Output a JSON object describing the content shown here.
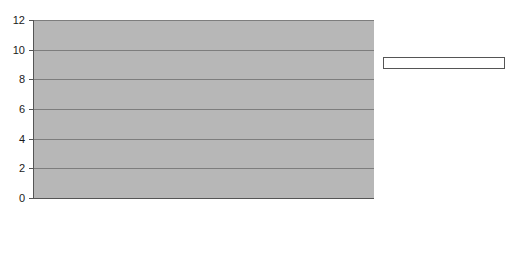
{
  "chart_data": {
    "type": "bar",
    "title": "",
    "xlabel": "",
    "ylabel": "",
    "ylim": [
      0,
      12
    ],
    "yticks": [
      0,
      2,
      4,
      6,
      8,
      10,
      12
    ],
    "grid": true,
    "legend_position": "right",
    "categories": [
      "Politics",
      "Economy",
      "Society",
      "Sports",
      "Technology",
      "Culture"
    ],
    "series": [
      {
        "name": "Ser",
        "color": "#8f8f8f",
        "values": [
          6,
          4,
          7,
          10,
          3,
          0
        ]
      },
      {
        "name": "Cope",
        "color": "#5e5e5e",
        "values": [
          5,
          5,
          7,
          5,
          0,
          0
        ]
      },
      {
        "name": "Onda Cero",
        "color": "#f2f2f2",
        "values": [
          2,
          2,
          0,
          0,
          0,
          1
        ]
      },
      {
        "name": "Punto Radio",
        "color": "#efefef",
        "values": [
          2,
          2,
          2,
          0,
          0,
          0
        ]
      },
      {
        "name": "RTVE/Radio Nacional",
        "color": "#3d3d3d",
        "values": [
          4,
          1,
          1,
          4,
          0,
          0
        ]
      }
    ]
  },
  "legend": {
    "items": [
      {
        "label": "Ser"
      },
      {
        "label": "Cope"
      },
      {
        "label": "Onda Cero"
      },
      {
        "label": "Punto Radio"
      },
      {
        "label": "RTVE/Radio Nacional"
      }
    ]
  }
}
